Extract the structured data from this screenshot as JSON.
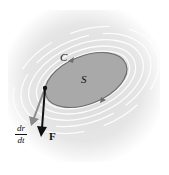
{
  "diagram": {
    "curve_label": "C",
    "surface_label": "S",
    "force_label": "F",
    "velocity_label": {
      "numerator": "dr",
      "denominator": "dt"
    },
    "colors": {
      "background": "#ececec",
      "surface_fill": "#a9a9a9",
      "surface_stroke": "#6e6e6e",
      "force_arrow": "#111111",
      "velocity_arrow": "#8a8a8a",
      "swirl": "#ffffff"
    }
  }
}
